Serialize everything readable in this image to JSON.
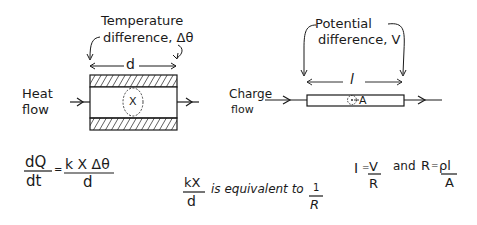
{
  "heat_diagram": {
    "title_line1": "Temperature",
    "title_line2": "difference, Δθ",
    "length_label": "d",
    "flow_label_line1": "Heat",
    "flow_label_line2": "flow",
    "area_label": "X"
  },
  "charge_diagram": {
    "title_line1": "Potential",
    "title_line2": "difference, V",
    "length_label": "l",
    "flow_label_line1": "Charge",
    "flow_label_line2": "flow",
    "area_label": "A"
  },
  "equations": {
    "heat": {
      "lhs_num": "dQ",
      "lhs_den": "dt",
      "eq": "=",
      "rhs_num": "k X Δθ",
      "rhs_den": "d"
    },
    "equivalence": {
      "lhs_num": "kX",
      "lhs_den": "d",
      "text": "is equivalent to",
      "rhs_num": "1",
      "rhs_den": "R"
    },
    "ohm": {
      "i_label": "I",
      "eq1": "=",
      "v_num": "V",
      "r_den": "R",
      "and_text": "and",
      "r_label": "R",
      "eq2": "=",
      "rho_l": "ρl",
      "a_den": "A"
    }
  },
  "colors": {
    "ink": "#1a1a1a",
    "background": "#ffffff"
  }
}
